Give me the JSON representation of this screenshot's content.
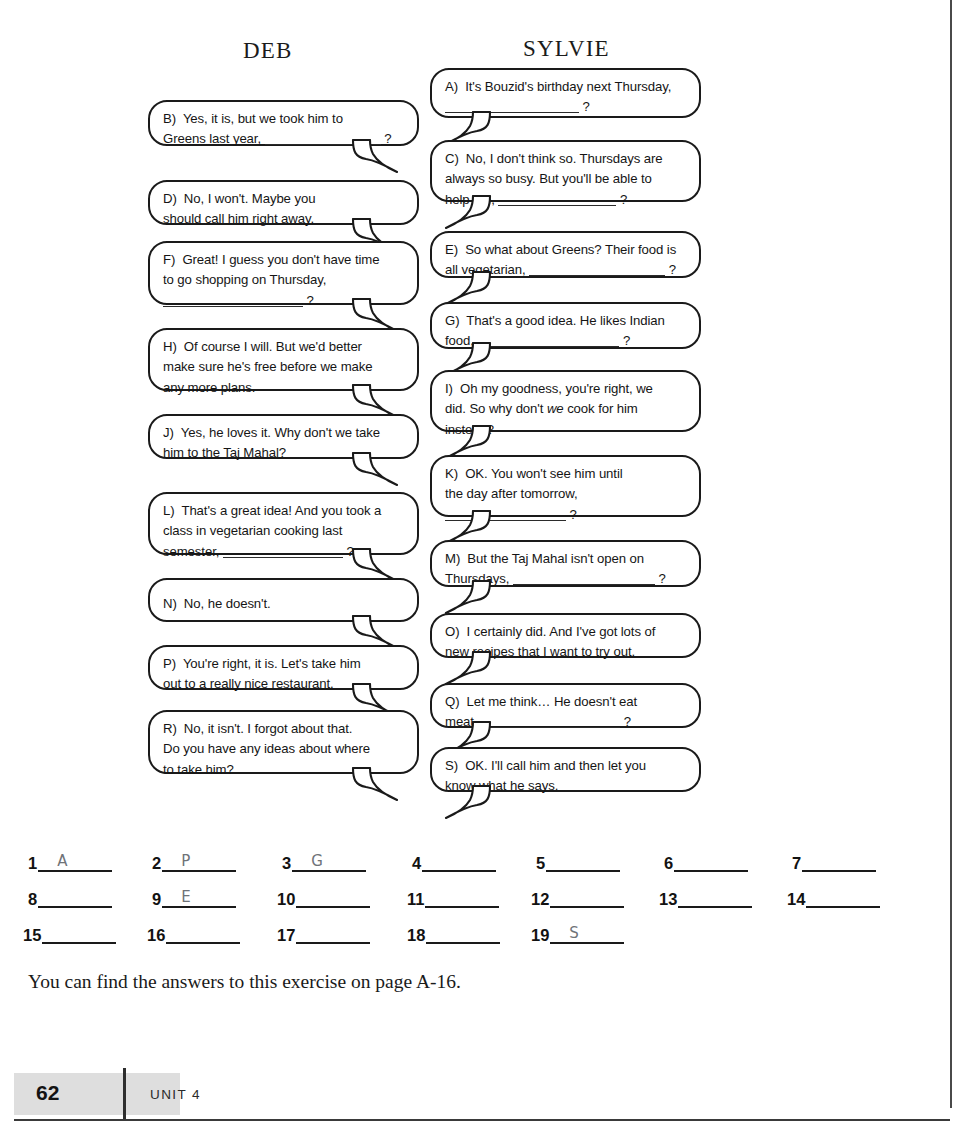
{
  "page": {
    "number": "62",
    "unit_label": "UNIT 4",
    "answer_note": "You can find the answers to this exercise on page A-16."
  },
  "columns": {
    "left_heading": "DEB",
    "right_heading": "SYLVIE"
  },
  "bubbles": {
    "A": {
      "label": "A)",
      "line1": "It's Bouzid's birthday next Thursday,",
      "line2_suffix": "?"
    },
    "B": {
      "label": "B)",
      "line1": "Yes, it is, but we took him to",
      "line2": "Greens last year,",
      "line2_suffix": "?"
    },
    "C": {
      "label": "C)",
      "line1": "No, I don't think so. Thursdays are",
      "line2": "always so busy. But you'll be able to",
      "line3": "help me,",
      "line3_suffix": "?"
    },
    "D": {
      "label": "D)",
      "line1": "No, I won't. Maybe you",
      "line2": "should call him right away."
    },
    "E": {
      "label": "E)",
      "line1": "So what about Greens? Their food is",
      "line2": "all vegetarian,",
      "line2_suffix": "?"
    },
    "F": {
      "label": "F)",
      "line1": "Great! I guess you don't have time",
      "line2": "to go shopping on Thursday,",
      "line3_suffix": "?"
    },
    "G": {
      "label": "G)",
      "line1": "That's a good idea. He likes Indian",
      "line2": "food,",
      "line2_suffix": "?"
    },
    "H": {
      "label": "H)",
      "line1": "Of course I will. But we'd better",
      "line2": "make sure he's free before we make",
      "line3": "any more plans."
    },
    "I": {
      "label": "I)",
      "line1": "Oh my goodness, you're right, we",
      "line2_pre": "did. So why don't ",
      "line2_em": "we",
      "line2_post": " cook for him",
      "line3": "instead?"
    },
    "J": {
      "label": "J)",
      "line1": "Yes, he loves it. Why don't we take",
      "line2": "him to the Taj Mahal?"
    },
    "K": {
      "label": "K)",
      "line1": "OK. You won't see him until",
      "line2": "the day after tomorrow,",
      "line3_suffix": "?"
    },
    "L": {
      "label": "L)",
      "line1": "That's a great idea! And you took a",
      "line2": "class in vegetarian cooking last",
      "line3": "semester,",
      "line3_suffix": "?"
    },
    "M": {
      "label": "M)",
      "line1": "But the Taj Mahal isn't open on",
      "line2": "Thursdays,",
      "line2_suffix": "?"
    },
    "N": {
      "label": "N)",
      "line1": "No, he doesn't."
    },
    "O": {
      "label": "O)",
      "line1": "I certainly did. And I've got lots of",
      "line2": "new recipes that I want to try out."
    },
    "P": {
      "label": "P)",
      "line1": "You're right, it is. Let's take him",
      "line2": "out to a really nice restaurant."
    },
    "Q": {
      "label": "Q)",
      "line1": "Let me think…  He doesn't eat",
      "line2": "meat,",
      "line2_suffix": "?"
    },
    "R": {
      "label": "R)",
      "line1": "No, it isn't. I forgot about that.",
      "line2": "Do you have any ideas about where",
      "line3": "to take him?"
    },
    "S": {
      "label": "S)",
      "line1": "OK. I'll call him and then let you",
      "line2": "know what he says."
    }
  },
  "answer_blanks": [
    {
      "number": "1",
      "written": "A"
    },
    {
      "number": "2",
      "written": "P"
    },
    {
      "number": "3",
      "written": "G"
    },
    {
      "number": "4",
      "written": ""
    },
    {
      "number": "5",
      "written": ""
    },
    {
      "number": "6",
      "written": ""
    },
    {
      "number": "7",
      "written": ""
    },
    {
      "number": "8",
      "written": ""
    },
    {
      "number": "9",
      "written": "E"
    },
    {
      "number": "10",
      "written": ""
    },
    {
      "number": "11",
      "written": ""
    },
    {
      "number": "12",
      "written": ""
    },
    {
      "number": "13",
      "written": ""
    },
    {
      "number": "14",
      "written": ""
    },
    {
      "number": "15",
      "written": ""
    },
    {
      "number": "16",
      "written": ""
    },
    {
      "number": "17",
      "written": ""
    },
    {
      "number": "18",
      "written": ""
    },
    {
      "number": "19",
      "written": "S"
    }
  ],
  "colors": {
    "ink": "#151515",
    "pencil": "#6f7378",
    "footer_band": "#dedede"
  }
}
